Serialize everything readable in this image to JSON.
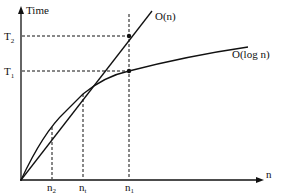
{
  "diagram": {
    "y_axis": {
      "label": "Time"
    },
    "x_axis": {
      "label": "n"
    },
    "curves": [
      {
        "label": "O(n)",
        "kind": "linear"
      },
      {
        "label": "O(log n)",
        "kind": "logarithmic"
      }
    ],
    "y_ticks": [
      {
        "label": "T",
        "sub": "2"
      },
      {
        "label": "T",
        "sub": "1"
      }
    ],
    "x_ticks": [
      {
        "label": "n",
        "sub": "2"
      },
      {
        "label": "n",
        "sub": "t"
      },
      {
        "label": "n",
        "sub": "1"
      }
    ]
  }
}
